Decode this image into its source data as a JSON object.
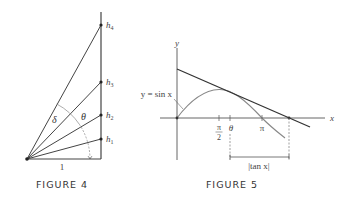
{
  "figure4": {
    "caption": "FIGURE 4",
    "base_label": "1",
    "points": [
      {
        "label": "h",
        "sub": "1"
      },
      {
        "label": "h",
        "sub": "2"
      },
      {
        "label": "h",
        "sub": "3"
      },
      {
        "label": "h",
        "sub": "4"
      }
    ],
    "angle_labels": {
      "delta": "δ",
      "theta": "θ"
    }
  },
  "figure5": {
    "caption": "FIGURE 5",
    "axis_labels": {
      "x": "x",
      "y": "y"
    },
    "curve_label": "y = sin x",
    "tick_labels": {
      "pi_over_2_num": "π",
      "pi_over_2_den": "2",
      "theta": "θ",
      "pi": "π"
    },
    "interval_label": "|tan x|"
  }
}
